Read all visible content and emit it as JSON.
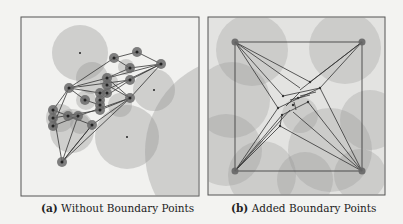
{
  "figure": {
    "subfigures": [
      {
        "label": "(a)",
        "caption": "Without Boundary Points"
      },
      {
        "label": "(b)",
        "caption": "Added Boundary Points"
      }
    ]
  },
  "colors": {
    "background": "#f3f3f1",
    "frame": "#555555",
    "disc": "#9a9a9a",
    "edge": "#333333",
    "node": "#555555"
  }
}
